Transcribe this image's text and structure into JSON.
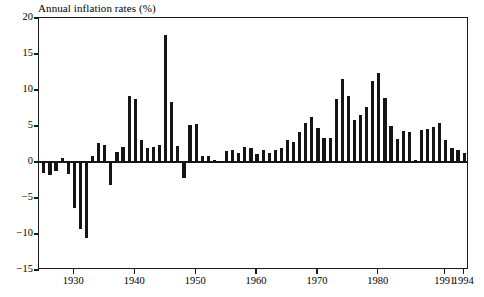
{
  "chart_data": {
    "type": "bar",
    "title": "Annual inflation rates (%)",
    "xlabel": "",
    "ylabel": "",
    "ylim": [
      -15,
      20
    ],
    "xlim": [
      1924.2,
      1994.8
    ],
    "grid": false,
    "legend": null,
    "bar_color": "#151515",
    "y_ticks": [
      20,
      15,
      10,
      5,
      0,
      -5,
      -10,
      -15
    ],
    "y_tick_labels": [
      "20",
      "15",
      "10",
      "5",
      "0",
      "-5",
      "-10",
      "-15"
    ],
    "x_ticks": [
      1930,
      1940,
      1950,
      1960,
      1970,
      1980,
      1991,
      1994
    ],
    "x_tick_labels": [
      "1930",
      "1940",
      "1950",
      "1960",
      "1970",
      "1980",
      "1991",
      "1994"
    ],
    "x": [
      1925,
      1926,
      1927,
      1928,
      1929,
      1930,
      1931,
      1932,
      1933,
      1934,
      1935,
      1936,
      1937,
      1938,
      1939,
      1940,
      1941,
      1942,
      1943,
      1944,
      1945,
      1946,
      1947,
      1948,
      1949,
      1950,
      1951,
      1952,
      1953,
      1954,
      1955,
      1956,
      1957,
      1958,
      1959,
      1960,
      1961,
      1962,
      1963,
      1964,
      1965,
      1966,
      1967,
      1968,
      1969,
      1970,
      1971,
      1972,
      1973,
      1974,
      1975,
      1976,
      1977,
      1978,
      1979,
      1980,
      1981,
      1982,
      1983,
      1984,
      1985,
      1986,
      1987,
      1988,
      1989,
      1990,
      1991,
      1992,
      1993,
      1994
    ],
    "values": [
      -1.5,
      -1.8,
      -1.2,
      0.5,
      -1.6,
      -6.4,
      -9.3,
      -10.5,
      0.8,
      2.6,
      2.3,
      -3.2,
      1.4,
      2.1,
      9.1,
      8.8,
      3.0,
      1.9,
      2.1,
      2.3,
      17.6,
      8.4,
      2.2,
      -2.2,
      5.1,
      5.3,
      0.8,
      0.9,
      0.3,
      0.1,
      1.5,
      1.6,
      1.3,
      2.1,
      2.0,
      1.1,
      1.7,
      1.2,
      1.7,
      2.0,
      3.0,
      2.8,
      4.2,
      5.4,
      6.3,
      4.7,
      3.4,
      3.4,
      8.7,
      11.5,
      9.1,
      5.8,
      6.5,
      7.7,
      11.3,
      12.4,
      8.9,
      5.0,
      3.2,
      4.3,
      4.1,
      0.3,
      4.4,
      4.6,
      4.8,
      5.4,
      3.1,
      2.0,
      1.7,
      1.2
    ]
  },
  "axes": {
    "y_axis_name": "inflation-percent-axis",
    "x_axis_name": "year-axis"
  }
}
